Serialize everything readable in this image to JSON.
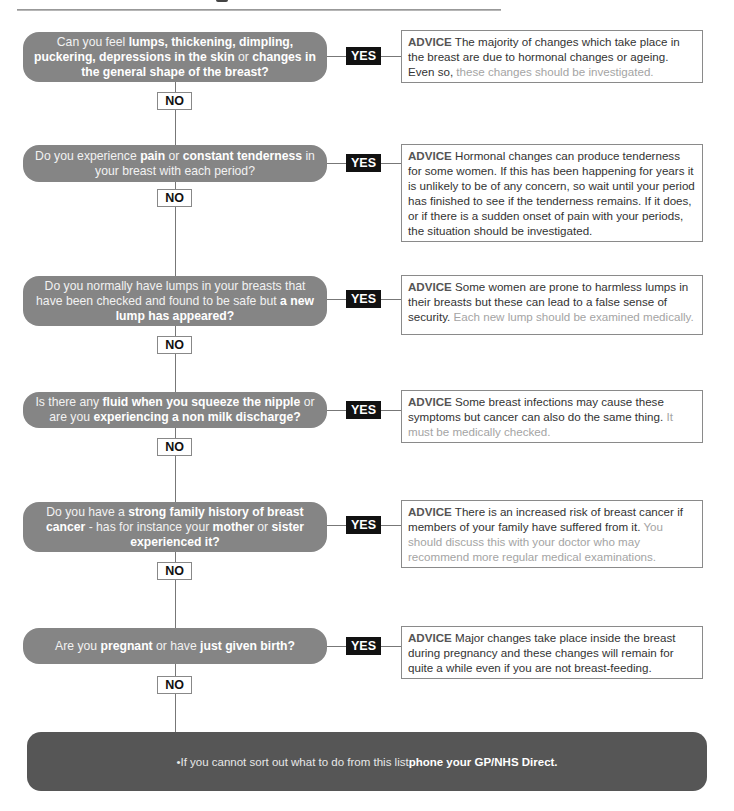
{
  "colors": {
    "question_fill": "#858585",
    "yes_fill": "#111111",
    "footer_fill": "#565656",
    "advice_border": "#8a8a8a"
  },
  "flow": {
    "yes_label": "YES",
    "no_label": "NO",
    "steps": [
      {
        "question": [
          {
            "t": "Can you feel ",
            "b": false
          },
          {
            "t": "lumps, thickening, dimpling, puckering, depressions in the skin",
            "b": true
          },
          {
            "t": " or ",
            "b": false
          },
          {
            "t": "changes in the general shape of the breast?",
            "b": true
          }
        ],
        "advice": [
          {
            "t": "ADVICE",
            "s": "lbl"
          },
          {
            "t": " The majority of changes which take place in the breast are due to hormonal changes or ageing. Even so, ",
            "s": ""
          },
          {
            "t": "these changes should be investigated.",
            "s": "mut"
          }
        ]
      },
      {
        "question": [
          {
            "t": "Do you experience ",
            "b": false
          },
          {
            "t": "pain",
            "b": true
          },
          {
            "t": " or ",
            "b": false
          },
          {
            "t": "constant tenderness",
            "b": true
          },
          {
            "t": " in your breast with each period?",
            "b": false
          }
        ],
        "advice": [
          {
            "t": "ADVICE",
            "s": "lbl"
          },
          {
            "t": " Hormonal changes can produce tenderness for some women. If this has been happening for years it is unlikely to be of any concern, so wait until your period has finished to see if the tenderness remains. If it does, or if there is a sudden onset of pain with your periods, the situation should be investigated.",
            "s": ""
          }
        ]
      },
      {
        "question": [
          {
            "t": "Do you normally have lumps in your breasts that have been checked and found to be safe but ",
            "b": false
          },
          {
            "t": "a new lump has appeared?",
            "b": true
          }
        ],
        "advice": [
          {
            "t": "ADVICE",
            "s": "lbl"
          },
          {
            "t": " Some women are prone to harmless lumps in their breasts but these can lead to a false sense of security. ",
            "s": ""
          },
          {
            "t": "Each new lump should be examined medically.",
            "s": "mut"
          }
        ]
      },
      {
        "question": [
          {
            "t": "Is there any ",
            "b": false
          },
          {
            "t": "fluid when you squeeze the nipple",
            "b": true
          },
          {
            "t": " or are you ",
            "b": false
          },
          {
            "t": "experiencing a non milk discharge?",
            "b": true
          }
        ],
        "advice": [
          {
            "t": "ADVICE",
            "s": "lbl"
          },
          {
            "t": " Some breast infections may cause these symptoms but cancer can also do the same thing. ",
            "s": ""
          },
          {
            "t": "It must be medically checked.",
            "s": "mut"
          }
        ]
      },
      {
        "question": [
          {
            "t": "Do you have a ",
            "b": false
          },
          {
            "t": "strong family history of breast cancer",
            "b": true
          },
          {
            "t": " - has for instance your ",
            "b": false
          },
          {
            "t": "mother",
            "b": true
          },
          {
            "t": " or ",
            "b": false
          },
          {
            "t": "sister experienced it?",
            "b": true
          }
        ],
        "advice": [
          {
            "t": "ADVICE",
            "s": "lbl"
          },
          {
            "t": " There is an increased risk of breast cancer if members of your family have suffered from it. ",
            "s": ""
          },
          {
            "t": "You should discuss this with your doctor who may recommend more regular medical examinations.",
            "s": "mut"
          }
        ]
      },
      {
        "question": [
          {
            "t": "Are you ",
            "b": false
          },
          {
            "t": "pregnant",
            "b": true
          },
          {
            "t": " or have ",
            "b": false
          },
          {
            "t": "just given birth?",
            "b": true
          }
        ],
        "advice": [
          {
            "t": "ADVICE",
            "s": "lbl"
          },
          {
            "t": " Major changes take place inside the breast during pregnancy and these changes will remain for quite a while even if you are not breast-feeding.",
            "s": ""
          }
        ]
      }
    ]
  },
  "footer": {
    "bullet": "•",
    "text": " If you cannot sort out what to do from this list ",
    "bold": "phone your GP/NHS Direct."
  }
}
